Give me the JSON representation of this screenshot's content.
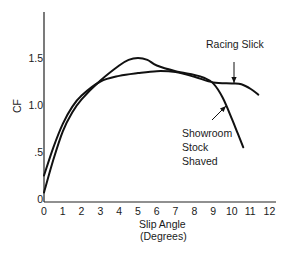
{
  "chart_data": {
    "type": "line",
    "title": "",
    "xlabel": "Slip Angle\n(Degrees)",
    "xlabel_lines": [
      "Slip Angle",
      "(Degrees)"
    ],
    "ylabel": "CF",
    "xlim": [
      0,
      12
    ],
    "ylim": [
      0,
      1.9
    ],
    "x_ticks": [
      "0",
      "1",
      "2",
      "3",
      "4",
      "5",
      "6",
      "7",
      "8",
      "9",
      "10",
      "11",
      "12"
    ],
    "y_ticks": [
      "0",
      ".5",
      "1.0",
      "1.5"
    ],
    "grid": false,
    "legend": "inline annotations with arrows",
    "series": [
      {
        "name": "Racing Slick",
        "x": [
          0,
          0.5,
          1,
          1.5,
          2,
          3,
          4,
          5,
          6,
          7,
          8,
          9,
          10,
          10.5,
          11,
          11.4
        ],
        "y": [
          0.25,
          0.55,
          0.8,
          0.98,
          1.1,
          1.25,
          1.31,
          1.34,
          1.36,
          1.35,
          1.3,
          1.24,
          1.23,
          1.22,
          1.17,
          1.11
        ]
      },
      {
        "name": "Showroom Stock Shaved",
        "x": [
          0,
          0.5,
          1,
          1.5,
          2,
          3,
          4,
          4.5,
          5,
          5.5,
          6,
          7,
          8,
          8.5,
          9,
          9.5,
          10,
          10.3,
          10.6
        ],
        "y": [
          0.07,
          0.42,
          0.72,
          0.92,
          1.06,
          1.26,
          1.42,
          1.48,
          1.5,
          1.48,
          1.42,
          1.36,
          1.32,
          1.29,
          1.23,
          1.08,
          0.85,
          0.7,
          0.55
        ]
      }
    ],
    "annotations": [
      {
        "text": "Racing Slick",
        "arrow_to": [
          10.0,
          1.23
        ]
      },
      {
        "text": "Showroom\nStock\nShaved",
        "lines": [
          "Showroom",
          "Stock",
          "Shaved"
        ],
        "arrow_to": [
          9.6,
          1.05
        ]
      }
    ]
  }
}
